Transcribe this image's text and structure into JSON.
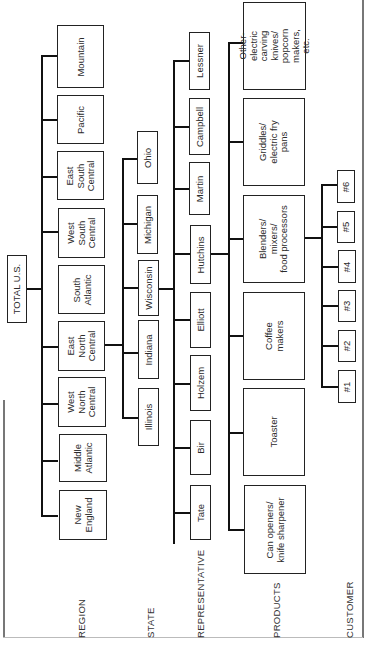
{
  "diagram": {
    "title": "TOTAL U.S.",
    "level_labels": [
      "REGION",
      "STATE",
      "REPRESENTATIVE",
      "PRODUCTS",
      "CUSTOMER"
    ],
    "regions": [
      "Mountain",
      "Pacific",
      "East\nSouth\nCentral",
      "West\nSouth\nCentral",
      "South\nAtlantic",
      "East\nNorth\nCentral",
      "West\nNorth\nCentral",
      "Middle\nAtlantic",
      "New\nEngland"
    ],
    "states": [
      "Ohio",
      "Michigan",
      "Wisconsin",
      "Indiana",
      "Illinois"
    ],
    "states_parent": "East North Central",
    "representatives": [
      "Lessner",
      "Campbell",
      "Martin",
      "Hutchins",
      "Elliott",
      "Holzem",
      "Bir",
      "Tate"
    ],
    "representatives_parent": "Wisconsin",
    "products": [
      "Other-\nelectric\ncarving\nknives/\npopcorn\nmakers,\netc.",
      "Griddles/\nelectric fry\npans",
      "Blenders/\nmixers/\nfood processors",
      "Coffee\nmakers",
      "Toaster",
      "Can openers/\nknife sharpener"
    ],
    "products_parent": "Hutchins",
    "customers": [
      "#6",
      "#5",
      "#4",
      "#3",
      "#2",
      "#1"
    ],
    "customers_parent": "Blenders/mixers/food processors"
  }
}
